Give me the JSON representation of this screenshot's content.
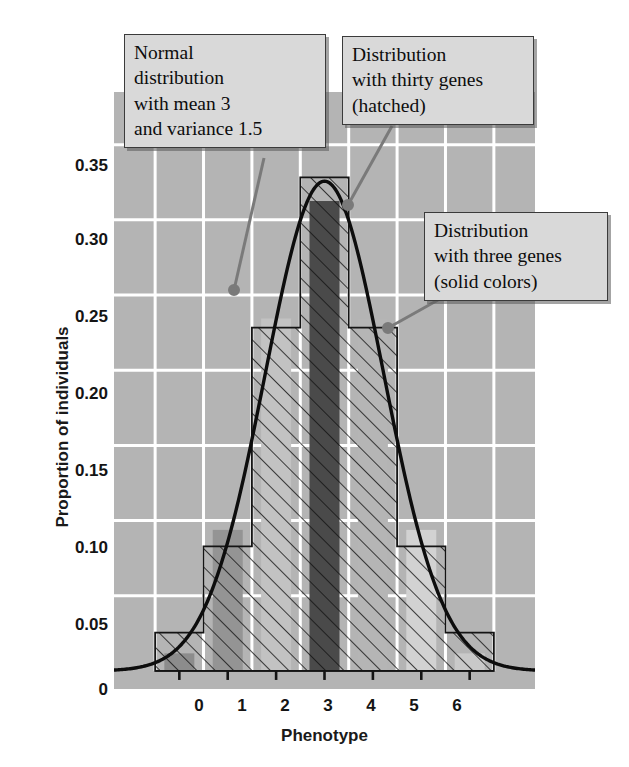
{
  "figure": {
    "background": "#ffffff",
    "plot_background": "#b4b4b4",
    "gridline_color": "#ffffff"
  },
  "axes": {
    "ylabel": "Proportion of individuals",
    "xlabel": "Phenotype",
    "yticks": [
      "0.35",
      "0.30",
      "0.25",
      "0.20",
      "0.15",
      "0.10",
      "0.05",
      "0"
    ],
    "xticks": [
      "0",
      "1",
      "2",
      "3",
      "4",
      "5",
      "6"
    ]
  },
  "callouts": {
    "normal": "Normal\ndistribution\nwith mean 3\nand variance 1.5",
    "thirty": "Distribution\nwith thirty genes\n(hatched)",
    "three": "Distribution\nwith three genes\n(solid colors)"
  },
  "chart_data": {
    "type": "bar",
    "title": "",
    "xlabel": "Phenotype",
    "ylabel": "Proportion of individuals",
    "xlim": [
      -1.35,
      7.35
    ],
    "ylim": [
      -0.012,
      0.385
    ],
    "grid": true,
    "legend_position": "callout-annotations",
    "categories": [
      "0",
      "1",
      "2",
      "3",
      "4",
      "5",
      "6"
    ],
    "series": [
      {
        "name": "Distribution with thirty genes (hatched)",
        "style": "hatched",
        "fill": "transparent",
        "edge": "#111111",
        "hatch": "/",
        "values": [
          0.0255,
          0.0828,
          0.2283,
          0.3282,
          0.2283,
          0.0828,
          0.0255
        ]
      },
      {
        "name": "Distribution with three genes (solid colors)",
        "style": "solid",
        "edge": "none",
        "values": [
          0.0117,
          0.0938,
          0.2344,
          0.3125,
          0.2344,
          0.0938,
          0.0117
        ],
        "bar_colors": [
          "#8c8c8c",
          "#949494",
          "#c2c2c2",
          "#4a4a4a",
          "#b5b5b5",
          "#d2d2d2",
          "#c9c9c9"
        ],
        "bar_width_fraction": 0.62
      },
      {
        "name": "Normal distribution with mean 3 and variance 1.5",
        "style": "line",
        "color": "#0d0d0d",
        "mean": 3,
        "variance": 1.5,
        "peak_value": 0.3257,
        "x": [
          -1.35,
          -1.0,
          -0.5,
          0.0,
          0.5,
          1.0,
          1.5,
          2.0,
          2.5,
          3.0,
          3.5,
          4.0,
          4.5,
          5.0,
          5.5,
          6.0,
          6.5,
          7.0,
          7.35
        ],
        "y": [
          0.0009,
          0.0021,
          0.0063,
          0.0163,
          0.0365,
          0.0709,
          0.1194,
          0.1739,
          0.2193,
          0.2393,
          0.2193,
          0.1739,
          0.1194,
          0.0709,
          0.0365,
          0.0163,
          0.0063,
          0.0021,
          0.0009
        ]
      }
    ]
  }
}
